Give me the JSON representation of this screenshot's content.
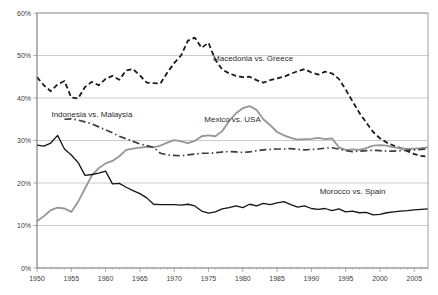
{
  "chart_data": {
    "type": "line",
    "title": "",
    "xlabel": "",
    "ylabel": "",
    "xlim": [
      1950,
      2007
    ],
    "ylim": [
      0,
      60
    ],
    "yunit": "%",
    "grid": "horizontal",
    "legend": "inline-annotations",
    "ytick_labels": [
      "0%",
      "10%",
      "20%",
      "30%",
      "40%",
      "50%",
      "60%"
    ],
    "ytick_values": [
      0,
      10,
      20,
      30,
      40,
      50,
      60
    ],
    "xtick_labels": [
      "1950",
      "1955",
      "1960",
      "1965",
      "1970",
      "1975",
      "1980",
      "1985",
      "1990",
      "1995",
      "2000",
      "2005"
    ],
    "xtick_values": [
      1950,
      1955,
      1960,
      1965,
      1970,
      1975,
      1980,
      1985,
      1990,
      1995,
      2000,
      2005
    ],
    "series": [
      {
        "name": "Macedonia vs. Greece",
        "style": "dashed",
        "color": "#1a1a1a",
        "width": 1.8,
        "dasharray": "5,3",
        "label_x": 1981.5,
        "label_y": 48.8,
        "x": [
          1950,
          1951,
          1952,
          1953,
          1954,
          1955,
          1956,
          1957,
          1958,
          1959,
          1960,
          1961,
          1962,
          1963,
          1964,
          1965,
          1966,
          1967,
          1968,
          1969,
          1970,
          1971,
          1972,
          1973,
          1974,
          1975,
          1976,
          1977,
          1978,
          1979,
          1980,
          1981,
          1982,
          1983,
          1984,
          1985,
          1986,
          1987,
          1988,
          1989,
          1990,
          1991,
          1992,
          1993,
          1994,
          1995,
          1996,
          1997,
          1998,
          1999,
          2000,
          2001,
          2002,
          2003,
          2004,
          2005,
          2006,
          2007
        ],
        "y": [
          44.9,
          43.0,
          41.6,
          43.2,
          44.0,
          40.1,
          39.9,
          42.6,
          43.8,
          43.0,
          44.5,
          45.2,
          44.3,
          46.5,
          46.8,
          45.3,
          43.6,
          43.5,
          43.4,
          46.0,
          48.2,
          50.0,
          53.5,
          54.2,
          51.8,
          53.0,
          49.0,
          46.7,
          45.8,
          45.2,
          44.9,
          45.0,
          44.2,
          43.6,
          44.2,
          44.6,
          45.0,
          45.7,
          46.3,
          46.8,
          46.0,
          45.5,
          46.2,
          45.8,
          44.5,
          42.0,
          39.2,
          36.5,
          34.2,
          32.0,
          30.5,
          29.5,
          28.8,
          28.2,
          27.5,
          26.8,
          26.4,
          26.2
        ]
      },
      {
        "name": "Mexico vs. USA",
        "style": "solid",
        "color": "#969696",
        "width": 1.8,
        "dasharray": "none",
        "label_x": 1978.5,
        "label_y": 34.3,
        "x": [
          1950,
          1951,
          1952,
          1953,
          1954,
          1955,
          1956,
          1957,
          1958,
          1959,
          1960,
          1961,
          1962,
          1963,
          1964,
          1965,
          1966,
          1967,
          1968,
          1969,
          1970,
          1971,
          1972,
          1973,
          1974,
          1975,
          1976,
          1977,
          1978,
          1979,
          1980,
          1981,
          1982,
          1983,
          1984,
          1985,
          1986,
          1987,
          1988,
          1989,
          1990,
          1991,
          1992,
          1993,
          1994,
          1995,
          1996,
          1997,
          1998,
          1999,
          2000,
          2001,
          2002,
          2003,
          2004,
          2005,
          2006,
          2007
        ],
        "y": [
          11.0,
          12.2,
          13.6,
          14.2,
          14.0,
          13.2,
          15.6,
          18.7,
          21.8,
          23.5,
          24.6,
          25.2,
          26.3,
          27.8,
          28.1,
          28.3,
          28.5,
          28.4,
          28.8,
          29.5,
          30.1,
          29.8,
          29.4,
          29.9,
          31.0,
          31.2,
          31.0,
          32.2,
          34.6,
          36.4,
          37.6,
          38.1,
          37.2,
          35.0,
          33.6,
          32.0,
          31.2,
          30.6,
          30.2,
          30.3,
          30.4,
          30.6,
          30.3,
          30.5,
          28.4,
          27.8,
          27.9,
          27.8,
          28.2,
          28.8,
          28.9,
          28.8,
          28.4,
          28.2,
          28.0,
          28.1,
          28.2,
          28.4
        ]
      },
      {
        "name": "Indonesia vs. Malaysia",
        "style": "dash-dot",
        "color": "#3c3c3c",
        "width": 1.7,
        "dasharray": "7,3,1.5,3",
        "label_x": 1958.0,
        "label_y": 35.6,
        "x": [
          1954,
          1955,
          1956,
          1957,
          1958,
          1959,
          1960,
          1961,
          1962,
          1963,
          1964,
          1965,
          1966,
          1967,
          1968,
          1969,
          1970,
          1971,
          1972,
          1973,
          1974,
          1975,
          1976,
          1977,
          1978,
          1979,
          1980,
          1981,
          1982,
          1983,
          1984,
          1985,
          1986,
          1987,
          1988,
          1989,
          1990,
          1991,
          1992,
          1993,
          1994,
          1995,
          1996,
          1997,
          1998,
          1999,
          2000,
          2001,
          2002,
          2003,
          2004,
          2005,
          2006,
          2007
        ],
        "y": [
          35.0,
          35.1,
          34.8,
          34.4,
          33.9,
          33.2,
          32.5,
          31.8,
          31.0,
          30.4,
          29.8,
          29.2,
          28.8,
          28.4,
          27.0,
          26.6,
          26.5,
          26.4,
          26.6,
          26.8,
          27.0,
          27.0,
          27.1,
          27.3,
          27.4,
          27.3,
          27.2,
          27.3,
          27.6,
          27.8,
          27.9,
          28.0,
          28.0,
          28.1,
          27.9,
          27.8,
          27.9,
          28.0,
          28.2,
          28.3,
          28.0,
          27.6,
          27.4,
          27.5,
          27.6,
          27.7,
          27.6,
          27.5,
          27.5,
          27.6,
          27.7,
          27.8,
          27.9,
          28.0
        ]
      },
      {
        "name": "Morocco vs. Spain",
        "style": "solid",
        "color": "#141414",
        "width": 1.3,
        "dasharray": "none",
        "label_x": 1996.0,
        "label_y": 17.3,
        "x": [
          1950,
          1951,
          1952,
          1953,
          1954,
          1955,
          1956,
          1957,
          1958,
          1959,
          1960,
          1961,
          1962,
          1963,
          1964,
          1965,
          1966,
          1967,
          1968,
          1969,
          1970,
          1971,
          1972,
          1973,
          1974,
          1975,
          1976,
          1977,
          1978,
          1979,
          1980,
          1981,
          1982,
          1983,
          1984,
          1985,
          1986,
          1987,
          1988,
          1989,
          1990,
          1991,
          1992,
          1993,
          1994,
          1995,
          1996,
          1997,
          1998,
          1999,
          2000,
          2001,
          2002,
          2003,
          2004,
          2005,
          2006,
          2007
        ],
        "y": [
          28.9,
          28.7,
          29.4,
          31.2,
          28.0,
          26.6,
          24.8,
          21.8,
          22.0,
          22.3,
          22.8,
          19.8,
          19.9,
          19.0,
          18.2,
          17.5,
          16.5,
          15.0,
          14.9,
          14.9,
          14.9,
          14.8,
          15.0,
          14.6,
          13.4,
          12.9,
          13.2,
          13.9,
          14.2,
          14.6,
          14.2,
          15.0,
          14.6,
          15.2,
          14.9,
          15.3,
          15.6,
          14.9,
          14.3,
          14.6,
          14.0,
          13.8,
          14.0,
          13.5,
          13.9,
          13.2,
          13.4,
          13.0,
          13.1,
          12.5,
          12.6,
          13.0,
          13.2,
          13.4,
          13.5,
          13.7,
          13.8,
          13.9
        ]
      }
    ]
  },
  "plot": {
    "left": 37,
    "top": 13,
    "right": 428,
    "bottom": 268
  }
}
